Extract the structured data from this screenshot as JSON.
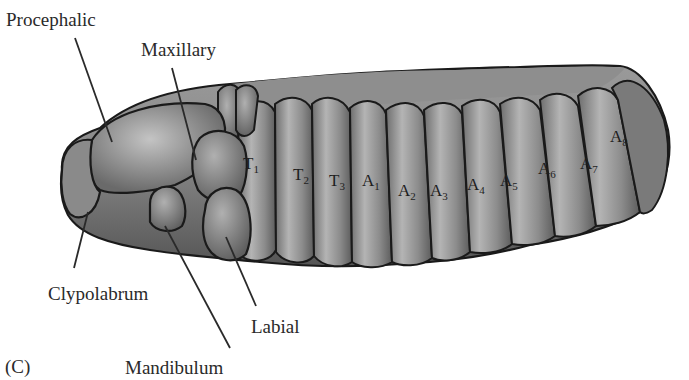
{
  "figure": {
    "panel_label": "(C)",
    "colors": {
      "background": "#ffffff",
      "body_fill_light": "#a8a8a8",
      "body_fill_dark": "#5a5a5a",
      "outline": "#1a1a1a",
      "label_text": "#2a2a2a",
      "leader_line": "#2a2a2a"
    }
  },
  "labels": {
    "procephalic": "Procephalic",
    "maxillary": "Maxillary",
    "clypolabrum": "Clypolabrum",
    "labial": "Labial",
    "mandibulum": "Mandibulum"
  },
  "segments": [
    {
      "letter": "T",
      "num": "1",
      "x": 243,
      "y": 155
    },
    {
      "letter": "T",
      "num": "2",
      "x": 293,
      "y": 166
    },
    {
      "letter": "T",
      "num": "3",
      "x": 329,
      "y": 172
    },
    {
      "letter": "A",
      "num": "1",
      "x": 362,
      "y": 172
    },
    {
      "letter": "A",
      "num": "2",
      "x": 398,
      "y": 182
    },
    {
      "letter": "A",
      "num": "3",
      "x": 430,
      "y": 182
    },
    {
      "letter": "A",
      "num": "4",
      "x": 467,
      "y": 176
    },
    {
      "letter": "A",
      "num": "5",
      "x": 500,
      "y": 172
    },
    {
      "letter": "A",
      "num": "6",
      "x": 538,
      "y": 160
    },
    {
      "letter": "A",
      "num": "7",
      "x": 580,
      "y": 155
    },
    {
      "letter": "A",
      "num": "8",
      "x": 610,
      "y": 128
    }
  ]
}
